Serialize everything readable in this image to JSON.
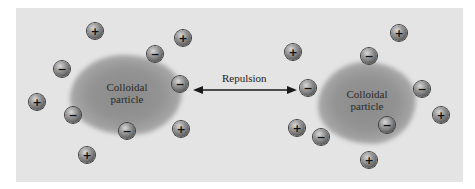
{
  "diagram": {
    "center_label": "Repulsion",
    "particles": [
      {
        "label_line1": "Colloidal",
        "label_line2": "particle",
        "side": "left"
      },
      {
        "label_line1": "Colloidal",
        "label_line2": "particle",
        "side": "right"
      }
    ],
    "ions": {
      "positive_symbol": "+",
      "negative_symbol": "−"
    },
    "colors": {
      "background": "#e4e4e4",
      "particle": "#8f8f8f",
      "ion": "#7a7a7a",
      "text": "#2a2a2a"
    }
  }
}
